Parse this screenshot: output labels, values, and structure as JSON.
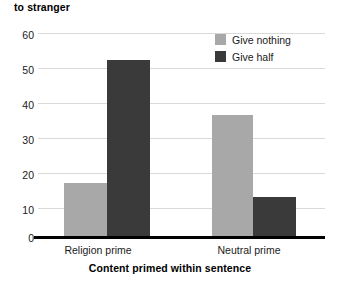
{
  "chart_data": {
    "type": "bar",
    "title": "to stranger",
    "subtitle": "",
    "xlabel": "Content primed within sentence",
    "ylabel": "",
    "categories": [
      "Religion prime",
      "Neutral prime"
    ],
    "series": [
      {
        "name": "Give nothing",
        "color": "#a8a8a8",
        "values": [
          16,
          36
        ]
      },
      {
        "name": "Give half",
        "color": "#3a3a3a",
        "values": [
          52,
          12
        ]
      }
    ],
    "ylim": [
      0,
      60
    ],
    "yticks": [
      0,
      10,
      20,
      30,
      40,
      50,
      60
    ],
    "ytick_labels": [
      "0",
      "10",
      "20",
      "30",
      "40",
      "50",
      "60"
    ],
    "grid": true,
    "legend_position": "top-right",
    "annotations": []
  },
  "legend": {
    "entries": [
      {
        "label": "Give nothing",
        "color": "#a8a8a8"
      },
      {
        "label": "Give half",
        "color": "#3a3a3a"
      }
    ]
  },
  "axis": {
    "y_ticks": [
      "60",
      "50",
      "40",
      "30",
      "20",
      "10",
      "0"
    ],
    "x_categories": [
      "Religion prime",
      "Neutral prime"
    ],
    "x_title": "Content primed within sentence"
  },
  "colors": {
    "give_nothing": "#a8a8a8",
    "give_half": "#3a3a3a",
    "gridline": "#d9d9d9",
    "axis": "#000000",
    "background": "#ffffff"
  }
}
